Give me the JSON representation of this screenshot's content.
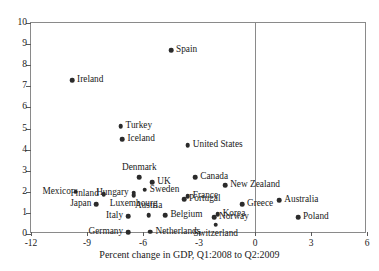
{
  "chart_data": {
    "type": "scatter",
    "title": "",
    "xlabel": "Percent change in GDP, Q1:2008 to Q2:2009",
    "ylabel": "",
    "xlim": [
      -12,
      6
    ],
    "ylim": [
      0,
      10
    ],
    "xticks": [
      -12,
      -9,
      -6,
      -3,
      0,
      3,
      6
    ],
    "yticks": [
      0,
      1,
      2,
      3,
      4,
      5,
      6,
      7,
      8,
      9,
      10
    ],
    "grid": false,
    "legend": null,
    "reference_lines": [
      {
        "axis": "x",
        "value": 0
      }
    ],
    "points": [
      {
        "label": "Spain",
        "x": -4.5,
        "y": 8.7,
        "pos": "r"
      },
      {
        "label": "Ireland",
        "x": -9.8,
        "y": 7.3,
        "pos": "r"
      },
      {
        "label": "Turkey",
        "x": -7.2,
        "y": 5.1,
        "pos": "r"
      },
      {
        "label": "Iceland",
        "x": -7.1,
        "y": 4.5,
        "pos": "r"
      },
      {
        "label": "United States",
        "x": -3.6,
        "y": 4.2,
        "pos": "r"
      },
      {
        "label": "Denmark",
        "x": -6.2,
        "y": 2.7,
        "pos": "a"
      },
      {
        "label": "UK",
        "x": -5.5,
        "y": 2.45,
        "pos": "r"
      },
      {
        "label": "Canada",
        "x": -3.2,
        "y": 2.7,
        "pos": "r"
      },
      {
        "label": "Sweden",
        "x": -5.9,
        "y": 2.1,
        "pos": "r"
      },
      {
        "label": "New Zealand",
        "x": -1.6,
        "y": 2.3,
        "pos": "r"
      },
      {
        "label": "Hungary",
        "x": -6.5,
        "y": 1.95,
        "pos": "l"
      },
      {
        "label": "Luxembourg",
        "x": -6.5,
        "y": 1.85,
        "pos": "b"
      },
      {
        "label": "Mexico",
        "x": -9.6,
        "y": 2.0,
        "pos": "l"
      },
      {
        "label": "Finland",
        "x": -8.1,
        "y": 1.9,
        "pos": "l"
      },
      {
        "label": "Australia",
        "x": 1.3,
        "y": 1.6,
        "pos": "r"
      },
      {
        "label": "France",
        "x": -3.6,
        "y": 1.8,
        "pos": "r"
      },
      {
        "label": "Portugal",
        "x": -3.8,
        "y": 1.65,
        "pos": "r"
      },
      {
        "label": "Japan",
        "x": -8.5,
        "y": 1.4,
        "pos": "l"
      },
      {
        "label": "Greece",
        "x": -0.7,
        "y": 1.4,
        "pos": "r"
      },
      {
        "label": "Austria",
        "x": -5.7,
        "y": 0.9,
        "pos": "a"
      },
      {
        "label": "Italy",
        "x": -6.8,
        "y": 0.85,
        "pos": "l"
      },
      {
        "label": "Belgium",
        "x": -4.8,
        "y": 0.9,
        "pos": "r"
      },
      {
        "label": "Korea",
        "x": -2.0,
        "y": 0.95,
        "pos": "r"
      },
      {
        "label": "Norway",
        "x": -2.2,
        "y": 0.8,
        "pos": "r"
      },
      {
        "label": "Switzerland",
        "x": -2.1,
        "y": 0.45,
        "pos": "b"
      },
      {
        "label": "Netherlands",
        "x": -5.6,
        "y": 0.1,
        "pos": "r"
      },
      {
        "label": "Germany",
        "x": -6.8,
        "y": 0.08,
        "pos": "l"
      },
      {
        "label": "Poland",
        "x": 2.3,
        "y": 0.8,
        "pos": "r"
      }
    ]
  }
}
